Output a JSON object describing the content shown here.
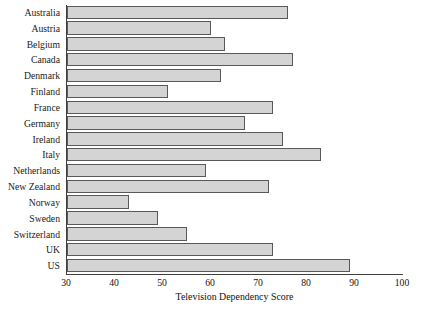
{
  "chart_data": {
    "type": "bar",
    "orientation": "horizontal",
    "title": "",
    "xlabel": "Television Dependency Score",
    "ylabel": "",
    "xlim": [
      30,
      100
    ],
    "xticks": [
      30,
      40,
      50,
      60,
      70,
      80,
      90,
      100
    ],
    "grid": false,
    "legend": null,
    "bar_color": "#d4d4d4",
    "bar_edge_color": "#595959",
    "axis_color": "#404040",
    "categories": [
      "Australia",
      "Austria",
      "Belgium",
      "Canada",
      "Denmark",
      "Finland",
      "France",
      "Germany",
      "Ireland",
      "Italy",
      "Netherlands",
      "New Zealand",
      "Norway",
      "Sweden",
      "Switzerland",
      "UK",
      "US"
    ],
    "values": [
      76,
      60,
      63,
      77,
      62,
      51,
      73,
      67,
      75,
      83,
      59,
      72,
      43,
      49,
      55,
      73,
      89
    ]
  }
}
